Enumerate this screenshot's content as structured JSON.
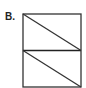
{
  "figure": {
    "label": "B.",
    "shape": "rectangle divided into two equal halves by a horizontal line, each half split by a diagonal from top-left to bottom-right",
    "stroke_color": "#333333",
    "background": "#ffffff"
  }
}
